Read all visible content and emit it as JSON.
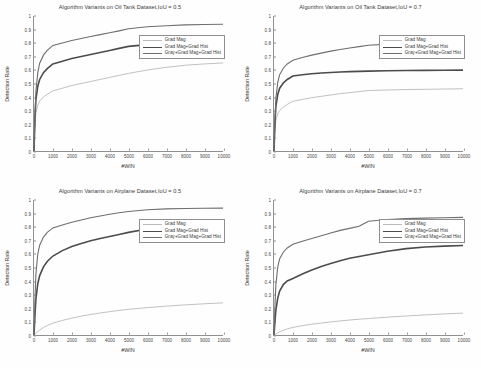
{
  "figure": {
    "background": "#fefefe",
    "axis_color": "#8f8f8f",
    "text_color": "#3a3a3a"
  },
  "series_styles": [
    {
      "name": "Grad Mag",
      "color": "#b9b9b9",
      "width": 0.9
    },
    {
      "name": "Grad Mag+Grad Hist",
      "color": "#4c4c4c",
      "width": 1.6
    },
    {
      "name": "Gray+Grad Mag+Grad Hist",
      "color": "#6e6e6e",
      "width": 1.1
    }
  ],
  "axis": {
    "xlabel": "#WIN",
    "ylabel": "Detection Rate",
    "xticks": [
      "0",
      "1000",
      "2000",
      "3000",
      "4000",
      "5000",
      "6000",
      "7000",
      "8000",
      "9000",
      "10000"
    ],
    "yticks": [
      "0",
      "0.1",
      "0.2",
      "0.3",
      "0.4",
      "0.5",
      "0.6",
      "0.7",
      "0.8",
      "0.9",
      "1"
    ],
    "xlim": [
      0,
      10000
    ],
    "ylim": [
      0,
      1
    ]
  },
  "chart_data": [
    {
      "type": "line",
      "title": "Algorithm Variants on Oil Tank Dataset,IoU = 0.5",
      "xlabel": "#WIN",
      "ylabel": "Detection Rate",
      "xlim": [
        0,
        10000
      ],
      "ylim": [
        0,
        1
      ],
      "grid": false,
      "legend_position": "upper right",
      "x": [
        0,
        50,
        100,
        200,
        300,
        500,
        700,
        1000,
        1500,
        2000,
        2500,
        3000,
        3500,
        4000,
        4500,
        5000,
        6000,
        7000,
        8000,
        9000,
        10000
      ],
      "series": [
        {
          "name": "Grad Mag",
          "values": [
            0.0,
            0.19,
            0.28,
            0.34,
            0.37,
            0.4,
            0.42,
            0.445,
            0.465,
            0.485,
            0.5,
            0.515,
            0.53,
            0.545,
            0.56,
            0.575,
            0.6,
            0.62,
            0.635,
            0.645,
            0.652
          ]
        },
        {
          "name": "Grad Mag+Grad Hist",
          "values": [
            0.0,
            0.24,
            0.38,
            0.48,
            0.53,
            0.58,
            0.61,
            0.645,
            0.665,
            0.685,
            0.7,
            0.715,
            0.73,
            0.745,
            0.76,
            0.775,
            0.788,
            0.795,
            0.8,
            0.806,
            0.81
          ]
        },
        {
          "name": "Gray+Grad Mag+Grad Hist",
          "values": [
            0.0,
            0.26,
            0.44,
            0.58,
            0.65,
            0.71,
            0.745,
            0.782,
            0.8,
            0.818,
            0.833,
            0.848,
            0.862,
            0.876,
            0.89,
            0.905,
            0.92,
            0.928,
            0.934,
            0.937,
            0.939
          ]
        }
      ]
    },
    {
      "type": "line",
      "title": "Algorithm Variants on Oil Tank Dataset,IoU = 0.7",
      "xlabel": "#WIN",
      "ylabel": "Detection Rate",
      "xlim": [
        0,
        10000
      ],
      "ylim": [
        0,
        1
      ],
      "grid": false,
      "legend_position": "upper right",
      "x": [
        0,
        50,
        100,
        200,
        300,
        500,
        700,
        1000,
        1500,
        2000,
        2500,
        3000,
        3500,
        4000,
        4500,
        5000,
        6000,
        7000,
        8000,
        9000,
        10000
      ],
      "series": [
        {
          "name": "Grad Mag",
          "values": [
            0.0,
            0.155,
            0.225,
            0.275,
            0.3,
            0.325,
            0.345,
            0.368,
            0.382,
            0.395,
            0.405,
            0.415,
            0.425,
            0.432,
            0.44,
            0.448,
            0.452,
            0.455,
            0.457,
            0.459,
            0.461
          ]
        },
        {
          "name": "Grad Mag+Grad Hist",
          "values": [
            0.0,
            0.21,
            0.33,
            0.42,
            0.465,
            0.505,
            0.53,
            0.555,
            0.565,
            0.572,
            0.578,
            0.582,
            0.585,
            0.588,
            0.59,
            0.592,
            0.594,
            0.596,
            0.597,
            0.598,
            0.599
          ]
        },
        {
          "name": "Gray+Grad Mag+Grad Hist",
          "values": [
            0.0,
            0.24,
            0.39,
            0.51,
            0.565,
            0.615,
            0.645,
            0.672,
            0.692,
            0.71,
            0.725,
            0.74,
            0.752,
            0.763,
            0.773,
            0.783,
            0.792,
            0.799,
            0.804,
            0.808,
            0.812
          ]
        }
      ]
    },
    {
      "type": "line",
      "title": "Algorithm Variants on Airplane Dataset,IoU = 0.5",
      "xlabel": "#WIN",
      "ylabel": "Detection Rate",
      "xlim": [
        0,
        10000
      ],
      "ylim": [
        0,
        1
      ],
      "grid": false,
      "legend_position": "upper right",
      "x": [
        0,
        50,
        100,
        200,
        300,
        500,
        700,
        1000,
        1500,
        2000,
        2500,
        3000,
        3500,
        4000,
        4500,
        5000,
        6000,
        7000,
        8000,
        9000,
        10000
      ],
      "series": [
        {
          "name": "Grad Mag",
          "values": [
            0.0,
            0.005,
            0.012,
            0.025,
            0.037,
            0.055,
            0.07,
            0.088,
            0.108,
            0.125,
            0.14,
            0.152,
            0.163,
            0.173,
            0.182,
            0.19,
            0.203,
            0.214,
            0.223,
            0.231,
            0.238
          ]
        },
        {
          "name": "Grad Mag+Grad Hist",
          "values": [
            0.0,
            0.145,
            0.265,
            0.38,
            0.44,
            0.505,
            0.545,
            0.585,
            0.625,
            0.655,
            0.678,
            0.698,
            0.715,
            0.73,
            0.745,
            0.76,
            0.785,
            0.805,
            0.82,
            0.833,
            0.845
          ]
        },
        {
          "name": "Gray+Grad Mag+Grad Hist",
          "values": [
            0.0,
            0.26,
            0.45,
            0.6,
            0.665,
            0.725,
            0.76,
            0.793,
            0.815,
            0.835,
            0.852,
            0.868,
            0.882,
            0.894,
            0.905,
            0.915,
            0.928,
            0.934,
            0.937,
            0.939,
            0.94
          ]
        }
      ]
    },
    {
      "type": "line",
      "title": "Algorithm Variants on Airplane Dataset,IoU = 0.7",
      "xlabel": "#WIN",
      "ylabel": "Detection Rate",
      "xlim": [
        0,
        10000
      ],
      "ylim": [
        0,
        1
      ],
      "grid": false,
      "legend_position": "upper right",
      "x": [
        0,
        50,
        100,
        200,
        300,
        500,
        700,
        1000,
        1500,
        2000,
        2500,
        3000,
        3500,
        4000,
        4500,
        5000,
        6000,
        7000,
        8000,
        9000,
        10000
      ],
      "series": [
        {
          "name": "Grad Mag",
          "values": [
            0.0,
            0.003,
            0.008,
            0.016,
            0.024,
            0.035,
            0.045,
            0.056,
            0.069,
            0.08,
            0.089,
            0.097,
            0.104,
            0.111,
            0.117,
            0.122,
            0.132,
            0.141,
            0.149,
            0.156,
            0.162
          ]
        },
        {
          "name": "Grad Mag+Grad Hist",
          "values": [
            0.0,
            0.1,
            0.185,
            0.275,
            0.325,
            0.375,
            0.4,
            0.418,
            0.452,
            0.482,
            0.508,
            0.53,
            0.55,
            0.568,
            0.582,
            0.595,
            0.62,
            0.64,
            0.652,
            0.658,
            0.663
          ]
        },
        {
          "name": "Gray+Grad Mag+Grad Hist",
          "values": [
            0.0,
            0.215,
            0.375,
            0.505,
            0.565,
            0.615,
            0.645,
            0.672,
            0.695,
            0.715,
            0.735,
            0.755,
            0.775,
            0.79,
            0.805,
            0.843,
            0.855,
            0.862,
            0.866,
            0.869,
            0.871
          ]
        }
      ]
    }
  ]
}
